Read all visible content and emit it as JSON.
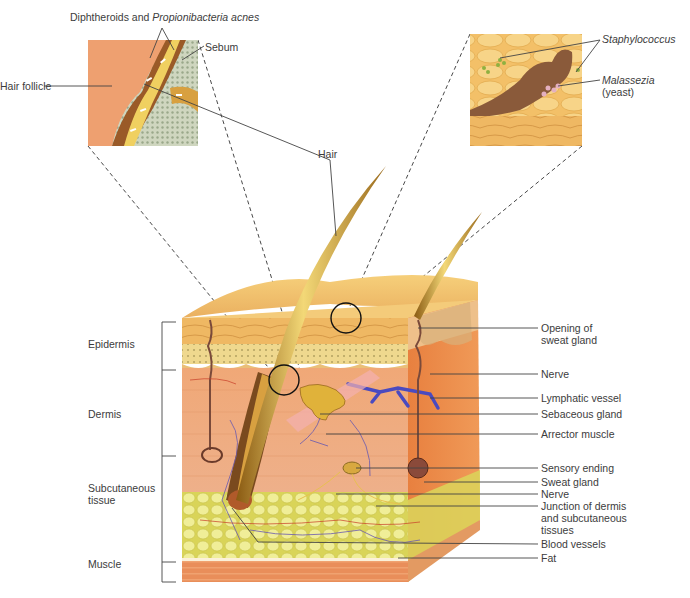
{
  "figure": {
    "insets": {
      "left": {
        "labels": {
          "bacteria_prefix": "Diphtheroids and ",
          "bacteria_italic": "Propionibacteria acnes",
          "sebum": "Sebum",
          "hair_follicle": "Hair follicle"
        }
      },
      "right": {
        "labels": {
          "staph": "Staphylococcus",
          "malassezia": "Malassezia",
          "malassezia_note": "(yeast)"
        }
      }
    },
    "hair_label": "Hair",
    "layers": [
      {
        "name": "Epidermis"
      },
      {
        "name": "Dermis"
      },
      {
        "name": "Subcutaneous tissue"
      },
      {
        "name": "Muscle"
      }
    ],
    "layer_labels": {
      "epidermis": "Epidermis",
      "dermis": "Dermis",
      "subcutaneous_l1": "Subcutaneous",
      "subcutaneous_l2": "tissue",
      "muscle": "Muscle"
    },
    "right_labels": {
      "opening_l1": "Opening of",
      "opening_l2": "sweat gland",
      "nerve_top": "Nerve",
      "lymphatic": "Lymphatic vessel",
      "sebaceous": "Sebaceous gland",
      "arrector": "Arrector muscle",
      "sensory": "Sensory ending",
      "sweat_gland": "Sweat gland",
      "nerve_bottom": "Nerve",
      "junction_l1": "Junction of dermis",
      "junction_l2": "and subcutaneous",
      "junction_l3": "tissues",
      "blood_vessels": "Blood vessels",
      "fat": "Fat"
    },
    "colors": {
      "epidermis": "#f2c06a",
      "dermis": "#eea67a",
      "fat": "#e8e27a",
      "muscle": "#e8b888",
      "hair": "#c9962c",
      "lymph": "#4a4ac0",
      "leader": "#444444"
    }
  }
}
